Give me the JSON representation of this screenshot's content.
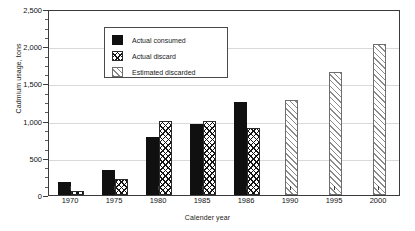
{
  "chart_data": {
    "type": "bar",
    "title": "",
    "xlabel": "Calender year",
    "ylabel": "Cadmium usage, tons",
    "categories": [
      "1970",
      "1975",
      "1980",
      "1985",
      "1986",
      "1990",
      "1995",
      "2000"
    ],
    "series": [
      {
        "name": "Actual consumed",
        "pattern": "solid-black",
        "color": "#101010",
        "values": [
          175,
          340,
          780,
          950,
          1250,
          null,
          null,
          null
        ]
      },
      {
        "name": "Actual discard",
        "pattern": "cross-hatch",
        "color": "#141414",
        "values": [
          50,
          210,
          1000,
          1000,
          900,
          null,
          null,
          null
        ]
      },
      {
        "name": "Estimated discarded",
        "pattern": "diagonal-hatch",
        "color": "#8a8a8a",
        "values": [
          null,
          null,
          null,
          null,
          null,
          1280,
          1660,
          2030
        ]
      }
    ],
    "ylim": [
      0,
      2500
    ],
    "ytick_values": [
      0,
      500,
      1000,
      1500,
      2000,
      2500
    ],
    "ytick_labels": [
      "0",
      "500",
      "1,000",
      "1,500",
      "2,000",
      "2,500"
    ],
    "yminor_interval": 125,
    "grid": true,
    "legend_position": "top-left",
    "legend_entries": [
      "Actual consumed",
      "Actual discard",
      "Estimated discarded"
    ]
  }
}
